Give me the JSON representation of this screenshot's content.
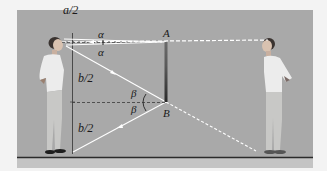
{
  "figure": {
    "colors": {
      "background": "#f3f3f3",
      "panel": "#a9a9a9",
      "floor_strip": "#c4c4c4",
      "floor_line": "#2b2b2b",
      "ray": "#ffffff",
      "axis_line": "#4a4a4a",
      "mirror": "#3a3a3a",
      "label": "#1a1a1a"
    },
    "labels": {
      "top_half_height": "a/2",
      "alpha_upper": "α",
      "alpha_lower": "α",
      "point_a": "A",
      "upper_half_body": "b/2",
      "beta_upper": "β",
      "beta_lower": "β",
      "point_b": "B",
      "lower_half_body": "b/2"
    },
    "elements": [
      "observer (left person)",
      "image of observer (right person)",
      "plane mirror AB",
      "incident and reflected rays",
      "dashed normal lines at A and B"
    ]
  }
}
